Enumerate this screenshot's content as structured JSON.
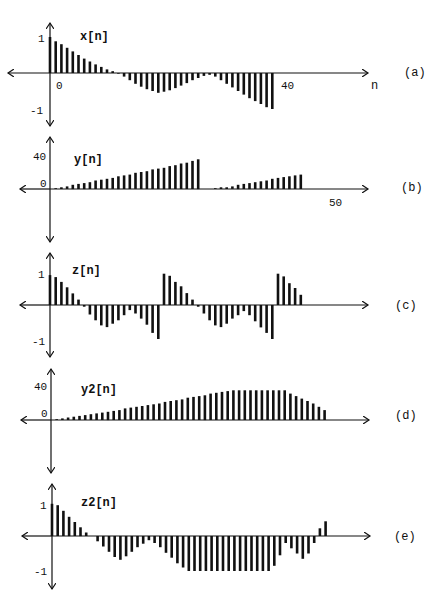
{
  "chart_data": [
    {
      "type": "stem",
      "panel_label": "(a)",
      "signal_label": "x[n]",
      "xlabel": "n",
      "x_tick_labels": [
        "0",
        "40"
      ],
      "y_tick_labels": [
        "1",
        "-1"
      ],
      "ylim": [
        -1,
        1
      ],
      "n": [
        0,
        1,
        2,
        3,
        4,
        5,
        6,
        7,
        8,
        9,
        10,
        11,
        12,
        13,
        14,
        15,
        16,
        17,
        18,
        19,
        20,
        21,
        22,
        23,
        24,
        25,
        26,
        27,
        28,
        29,
        30,
        31,
        32,
        33,
        34,
        35,
        36,
        37,
        38,
        39
      ],
      "values": [
        1.0,
        0.88,
        0.8,
        0.7,
        0.6,
        0.5,
        0.4,
        0.32,
        0.24,
        0.17,
        0.1,
        0.05,
        -0.02,
        -0.1,
        -0.2,
        -0.3,
        -0.38,
        -0.45,
        -0.5,
        -0.55,
        -0.52,
        -0.48,
        -0.42,
        -0.35,
        -0.28,
        -0.2,
        -0.14,
        -0.08,
        -0.05,
        -0.1,
        -0.2,
        -0.3,
        -0.4,
        -0.5,
        -0.6,
        -0.7,
        -0.78,
        -0.86,
        -0.95,
        -1.0
      ]
    },
    {
      "type": "stem",
      "panel_label": "(b)",
      "signal_label": "y[n]",
      "x_tick_labels": [
        "50"
      ],
      "y_tick_labels": [
        "40",
        "0"
      ],
      "ylim": [
        0,
        40
      ],
      "n": [
        1,
        2,
        3,
        4,
        5,
        6,
        7,
        8,
        9,
        10,
        11,
        12,
        13,
        14,
        15,
        16,
        17,
        18,
        19,
        20,
        21,
        22,
        23,
        24,
        25,
        26,
        27,
        28,
        29,
        30,
        31,
        32,
        33,
        34,
        35,
        36,
        37,
        38,
        39,
        40,
        41,
        42,
        43,
        44
      ],
      "values": [
        1,
        2,
        3,
        5,
        6,
        7,
        8,
        10,
        11,
        12,
        13,
        15,
        16,
        17,
        19,
        20,
        21,
        23,
        24,
        25,
        27,
        28,
        30,
        31,
        33,
        35,
        0,
        0,
        1,
        2,
        2,
        3,
        5,
        6,
        7,
        8,
        9,
        10,
        12,
        13,
        14,
        15,
        16,
        17
      ]
    },
    {
      "type": "stem",
      "panel_label": "(c)",
      "signal_label": "z[n]",
      "y_tick_labels": [
        "1",
        "-1"
      ],
      "ylim": [
        -1,
        1
      ],
      "n": [
        0,
        1,
        2,
        3,
        4,
        5,
        6,
        7,
        8,
        9,
        10,
        11,
        12,
        13,
        14,
        15,
        16,
        17,
        18,
        19,
        20,
        21,
        22,
        23,
        24,
        25,
        26,
        27,
        28,
        29,
        30,
        31,
        32,
        33,
        34,
        35,
        36,
        37,
        38,
        39,
        40,
        41,
        42,
        43,
        44
      ],
      "values": [
        0.88,
        0.82,
        0.68,
        0.52,
        0.34,
        0.16,
        -0.05,
        -0.28,
        -0.45,
        -0.6,
        -0.65,
        -0.55,
        -0.45,
        -0.3,
        -0.15,
        -0.25,
        -0.4,
        -0.58,
        -0.82,
        -1.0,
        0.92,
        0.86,
        0.68,
        0.55,
        0.35,
        0.16,
        -0.05,
        -0.25,
        -0.45,
        -0.6,
        -0.65,
        -0.55,
        -0.4,
        -0.3,
        -0.18,
        -0.3,
        -0.48,
        -0.66,
        -0.82,
        -1.0,
        0.92,
        0.84,
        0.64,
        0.5,
        0.3
      ]
    },
    {
      "type": "stem",
      "panel_label": "(d)",
      "signal_label": "y2[n]",
      "y_tick_labels": [
        "40",
        "0"
      ],
      "ylim": [
        0,
        40
      ],
      "n": [
        1,
        2,
        3,
        4,
        5,
        6,
        7,
        8,
        9,
        10,
        11,
        12,
        13,
        14,
        15,
        16,
        17,
        18,
        19,
        20,
        21,
        22,
        23,
        24,
        25,
        26,
        27,
        28,
        29,
        30,
        31,
        32,
        33,
        34,
        35,
        36,
        37,
        38,
        39,
        40,
        41,
        42,
        43,
        44,
        45,
        46,
        47,
        48
      ],
      "values": [
        1,
        2,
        3,
        4,
        5,
        6,
        7,
        8,
        9,
        10,
        11,
        12,
        14,
        15,
        16,
        17,
        18,
        19,
        20,
        22,
        23,
        24,
        25,
        27,
        28,
        29,
        30,
        32,
        33,
        34,
        35,
        36,
        36,
        36,
        36,
        36,
        36,
        36,
        36,
        36,
        36,
        32,
        29,
        26,
        23,
        20,
        16,
        12
      ]
    },
    {
      "type": "stem",
      "panel_label": "(e)",
      "signal_label": "z2[n]",
      "y_tick_labels": [
        "1",
        "-1"
      ],
      "ylim": [
        -1,
        1
      ],
      "n": [
        0,
        1,
        2,
        3,
        4,
        5,
        6,
        7,
        8,
        9,
        10,
        11,
        12,
        13,
        14,
        15,
        16,
        17,
        18,
        19,
        20,
        21,
        22,
        23,
        24,
        25,
        26,
        27,
        28,
        29,
        30,
        31,
        32,
        33,
        34,
        35,
        36,
        37,
        38,
        39,
        40,
        41,
        42,
        43,
        44,
        45,
        46,
        47,
        48
      ],
      "values": [
        0.92,
        0.88,
        0.72,
        0.55,
        0.4,
        0.25,
        0.1,
        0,
        -0.15,
        -0.3,
        -0.45,
        -0.6,
        -0.68,
        -0.58,
        -0.45,
        -0.32,
        -0.22,
        -0.12,
        -0.2,
        -0.32,
        -0.48,
        -0.62,
        -0.78,
        -0.9,
        -1.0,
        -1.0,
        -1.0,
        -1.0,
        -1.0,
        -1.0,
        -1.0,
        -1.0,
        -1.0,
        -1.0,
        -1.0,
        -1.0,
        -1.0,
        -1.0,
        -1.0,
        -0.85,
        -0.55,
        -0.2,
        -0.35,
        -0.5,
        -0.65,
        -0.5,
        -0.2,
        0.22,
        0.42,
        0.7
      ]
    }
  ],
  "panels": [
    {
      "label": "(a)",
      "signal": "x[n]",
      "x_axis_name": "n",
      "ticks": {
        "pos1": "1",
        "neg1": "-1",
        "x0": "0",
        "x40": "40"
      }
    },
    {
      "label": "(b)",
      "signal": "y[n]",
      "ticks": {
        "top": "40",
        "zero": "0",
        "x50": "50"
      }
    },
    {
      "label": "(c)",
      "signal": "z[n]",
      "ticks": {
        "pos1": "1",
        "neg1": "-1"
      }
    },
    {
      "label": "(d)",
      "signal": "y2[n]",
      "ticks": {
        "top": "40",
        "zero": "0"
      }
    },
    {
      "label": "(e)",
      "signal": "z2[n]",
      "ticks": {
        "pos1": "1",
        "neg1": "-1"
      }
    }
  ]
}
